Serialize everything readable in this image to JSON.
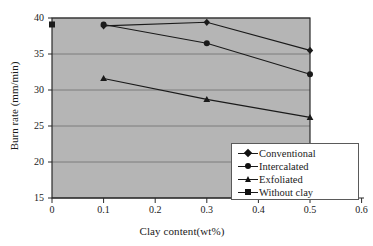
{
  "chart_data": {
    "type": "line",
    "title": "",
    "xlabel": "Clay content(wt%)",
    "ylabel": "Burn rate (mm/min)",
    "xlim": [
      0,
      0.6
    ],
    "ylim": [
      15,
      40
    ],
    "xticks": [
      "0",
      "0.1",
      "0.2",
      "0.3",
      "0.4",
      "0.5",
      "0.6"
    ],
    "yticks": [
      "15",
      "20",
      "25",
      "30",
      "35",
      "40"
    ],
    "grid": "horizontal",
    "legend_position": "lower-right",
    "plot_background": "#b5b5b5",
    "line_color": "#1a1a1a",
    "series": [
      {
        "name": "Conventional",
        "marker": "diamond",
        "x": [
          0.1,
          0.3,
          0.5
        ],
        "values": [
          38.9,
          39.4,
          35.5
        ]
      },
      {
        "name": "Intercalated",
        "marker": "circle",
        "x": [
          0.1,
          0.3,
          0.5
        ],
        "values": [
          39.1,
          36.5,
          32.2
        ]
      },
      {
        "name": "Exfoliated",
        "marker": "triangle",
        "x": [
          0.1,
          0.3,
          0.5
        ],
        "values": [
          31.6,
          28.7,
          26.2
        ]
      },
      {
        "name": "Without clay",
        "marker": "square",
        "x": [
          0.0
        ],
        "values": [
          39.1
        ]
      }
    ]
  },
  "legend": {
    "items": [
      {
        "label": "Conventional"
      },
      {
        "label": "Intercalated"
      },
      {
        "label": "Exfoliated"
      },
      {
        "label": "Without clay"
      }
    ]
  }
}
